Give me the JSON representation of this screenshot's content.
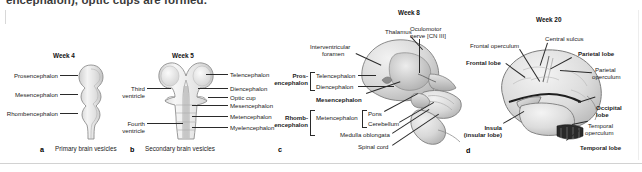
{
  "figure": {
    "running_text": "encephalon), optic cups are formed.",
    "panels": [
      {
        "letter": "a",
        "title": "Week 4",
        "caption": "Primary brain vesicles",
        "labels": [
          {
            "text": "Prosencephalon"
          },
          {
            "text": "Mesencephalon"
          },
          {
            "text": "Rhombencephalon"
          }
        ]
      },
      {
        "letter": "b",
        "title": "Week 5",
        "caption": "Secondary brain vesicles",
        "labels_left": [
          {
            "text": "Third",
            "text2": "ventricle"
          },
          {
            "text": "Fourth",
            "text2": "ventricle"
          }
        ],
        "labels_right": [
          {
            "text": "Telencephalon"
          },
          {
            "text": "Diencephalon"
          },
          {
            "text": "Optic cup"
          },
          {
            "text": "Mesencephalon"
          },
          {
            "text": "Metencephalon"
          },
          {
            "text": "Myelencephalon"
          }
        ]
      },
      {
        "letter": "c",
        "title": "Week 8",
        "caption": "",
        "bracket_labels": [
          {
            "text": "Pros-",
            "text2": "encephalon"
          },
          {
            "text": "Rhomb-",
            "text2": "encephalon"
          }
        ],
        "labels": [
          {
            "text": "Thalamus"
          },
          {
            "text": "Interventricular",
            "text2": "foramen"
          },
          {
            "text": "Oculomotor",
            "text2": "nerve [CN III]"
          },
          {
            "text": "Telencephalon"
          },
          {
            "text": "Diencephalon"
          },
          {
            "text": "Mesencephalon"
          },
          {
            "text": "Metencephalon"
          },
          {
            "text": "Pons"
          },
          {
            "text": "Cerebellum"
          },
          {
            "text": "Medulla oblongata"
          },
          {
            "text": "Spinal cord"
          }
        ]
      },
      {
        "letter": "d",
        "title": "Week 20",
        "caption": "",
        "labels": [
          {
            "text": "Frontal operculum"
          },
          {
            "text": "Central sulcus"
          },
          {
            "text": "Frontal lobe"
          },
          {
            "text": "Parietal lobe"
          },
          {
            "text": "Parietal",
            "text2": "operculum"
          },
          {
            "text": "Occipital",
            "text2": "lobe"
          },
          {
            "text": "Temporal",
            "text2": "operculum"
          },
          {
            "text": "Temporal lobe"
          },
          {
            "text": "Insula",
            "text2": "(insular lobe)"
          }
        ]
      }
    ]
  },
  "text": {
    "running": "encephalon), optic cups are formed.",
    "a_title": "Week 4",
    "a_cap": "Primary brain vesicles",
    "a_letter": "a",
    "a_l1": "Prosencephalon",
    "a_l2": "Mesencephalon",
    "a_l3": "Rhombencephalon",
    "b_title": "Week 5",
    "b_cap": "Secondary brain vesicles",
    "b_letter": "b",
    "b_third": "Third",
    "b_third2": "ventricle",
    "b_fourth": "Fourth",
    "b_fourth2": "ventricle",
    "b_r1": "Telencephalon",
    "b_r2": "Diencephalon",
    "b_r3": "Optic cup",
    "b_r4": "Mesencephalon",
    "b_r5": "Metencephalon",
    "b_r6": "Myelencephalon",
    "c_title": "Week 8",
    "c_letter": "c",
    "c_thalamus": "Thalamus",
    "c_ivf1": "Interventricular",
    "c_ivf2": "foramen",
    "c_ocn1": "Oculomotor",
    "c_ocn2": "nerve [CN III]",
    "c_pros1": "Pros-",
    "c_pros2": "encephalon",
    "c_tel": "Telencephalon",
    "c_di": "Diencephalon",
    "c_mes": "Mesencephalon",
    "c_rhomb1": "Rhomb-",
    "c_rhomb2": "encephalon",
    "c_met": "Metencephalon",
    "c_pons": "Pons",
    "c_cereb": "Cerebellum",
    "c_medulla": "Medulla oblongata",
    "c_spinal": "Spinal cord",
    "d_title": "Week 20",
    "d_letter": "d",
    "d_frontop": "Frontal operculum",
    "d_csulcus": "Central sulcus",
    "d_frontlobe": "Frontal lobe",
    "d_parlobe": "Parietal lobe",
    "d_parop1": "Parietal",
    "d_parop2": "operculum",
    "d_occ1": "Occipital",
    "d_occ2": "lobe",
    "d_temop1": "Temporal",
    "d_temop2": "operculum",
    "d_temlobe": "Temporal lobe",
    "d_insula1": "Insula",
    "d_insula2": "(insular lobe)"
  },
  "colors": {
    "brain_fill": "#e8e8e8",
    "brain_stroke": "#8a8a8a",
    "leader": "#2a2a2a",
    "text": "#1b1b1b",
    "rule": "#d2d2d2"
  }
}
